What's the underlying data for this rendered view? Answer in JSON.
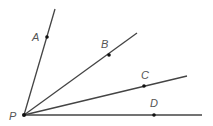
{
  "diagram": {
    "type": "rays-from-common-endpoint",
    "vertex": {
      "label": "P",
      "x": 24,
      "y": 115,
      "label_x": 9,
      "label_y": 120
    },
    "rays": [
      {
        "id": "PA",
        "end_x": 55,
        "end_y": 9,
        "point": {
          "label": "A",
          "x": 47,
          "y": 37,
          "label_x": 32,
          "label_y": 41
        }
      },
      {
        "id": "PB",
        "end_x": 137,
        "end_y": 33,
        "point": {
          "label": "B",
          "x": 109,
          "y": 55,
          "label_x": 101,
          "label_y": 48
        }
      },
      {
        "id": "PC",
        "end_x": 187,
        "end_y": 76,
        "point": {
          "label": "C",
          "x": 144,
          "y": 86,
          "label_x": 141,
          "label_y": 79
        }
      },
      {
        "id": "PD",
        "end_x": 202,
        "end_y": 115,
        "point": {
          "label": "D",
          "x": 154,
          "y": 115,
          "label_x": 150,
          "label_y": 107
        }
      }
    ],
    "colors": {
      "line": "#444444",
      "point": "#111111",
      "label": "#555555",
      "background": "#ffffff"
    }
  }
}
